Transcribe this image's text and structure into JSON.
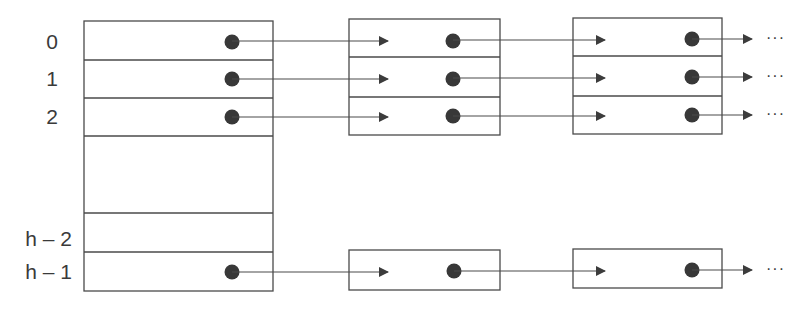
{
  "diagram": {
    "colors": {
      "stroke": "#4a4a4a",
      "dot": "#383838",
      "text": "#3a3a3a",
      "background": "#ffffff"
    },
    "table": {
      "rows": [
        {
          "index_label": "0",
          "has_pointer": true
        },
        {
          "index_label": "1",
          "has_pointer": true
        },
        {
          "index_label": "2",
          "has_pointer": true
        },
        {
          "index_label": "",
          "has_pointer": false,
          "gap": true
        },
        {
          "index_label": "h – 2",
          "has_pointer": false
        },
        {
          "index_label": "h – 1",
          "has_pointer": true
        }
      ]
    },
    "chains": [
      {
        "row": "0",
        "nodes": 2,
        "continuation": "…"
      },
      {
        "row": "1",
        "nodes": 2,
        "continuation": "…"
      },
      {
        "row": "2",
        "nodes": 2,
        "continuation": "…"
      },
      {
        "row": "h – 1",
        "nodes": 2,
        "continuation": "…"
      }
    ],
    "continuation_symbol": "···"
  }
}
